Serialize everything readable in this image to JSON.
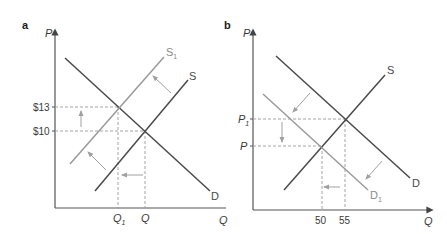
{
  "figure": {
    "panels": [
      {
        "id": "a",
        "label": "a",
        "y_axis_label": "P",
        "x_axis_label": "Q",
        "y_ticks": [
          {
            "label": "$13",
            "value": 13
          },
          {
            "label": "$10",
            "value": 10
          }
        ],
        "x_ticks": [
          {
            "label": "Q",
            "sub": "1"
          },
          {
            "label": "Q",
            "sub": ""
          }
        ],
        "curves": [
          {
            "name": "D",
            "label": "D",
            "sub": "",
            "type": "demand",
            "color": "#4a4a4a"
          },
          {
            "name": "S",
            "label": "S",
            "sub": "",
            "type": "supply",
            "color": "#4a4a4a"
          },
          {
            "name": "S1",
            "label": "S",
            "sub": "1",
            "type": "supply-shifted",
            "color": "#9a9a9a"
          }
        ],
        "annotation": "Supply shifts left from S to S1; price rises from $10 to $13; quantity falls from Q to Q1"
      },
      {
        "id": "b",
        "label": "b",
        "y_axis_label": "P",
        "x_axis_label": "Q",
        "y_ticks": [
          {
            "label": "P",
            "sub": "1"
          },
          {
            "label": "P",
            "sub": ""
          }
        ],
        "x_ticks": [
          {
            "label": "50",
            "value": 50
          },
          {
            "label": "55",
            "value": 55
          }
        ],
        "curves": [
          {
            "name": "S",
            "label": "S",
            "sub": "",
            "type": "supply",
            "color": "#4a4a4a"
          },
          {
            "name": "D",
            "label": "D",
            "sub": "",
            "type": "demand",
            "color": "#4a4a4a"
          },
          {
            "name": "D1",
            "label": "D",
            "sub": "1",
            "type": "demand-shifted",
            "color": "#9a9a9a"
          }
        ],
        "annotation": "Demand shifts left from D to D1; price falls from P1 to P; quantity falls from 55 to 50"
      }
    ]
  },
  "colors": {
    "axis": "#555555",
    "curve_dark": "#4a4a4a",
    "curve_light": "#9a9a9a",
    "dashed": "#9a9a9a",
    "arrow": "#a0a0a0"
  }
}
